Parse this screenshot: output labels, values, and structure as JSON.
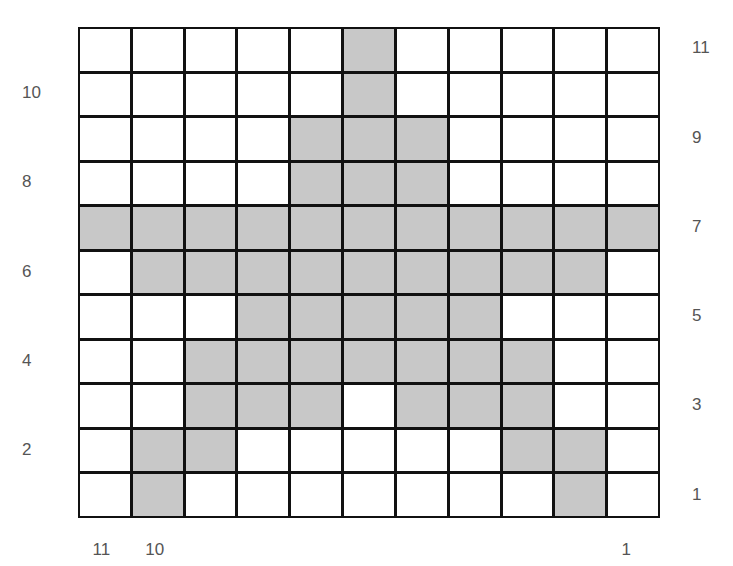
{
  "figure": {
    "rows": 11,
    "cols": 11,
    "shade_color": "#c8c8c8",
    "line_color": "#111111",
    "left_labels": [
      {
        "text": "10",
        "row": 10
      },
      {
        "text": "8",
        "row": 8
      },
      {
        "text": "6",
        "row": 6
      },
      {
        "text": "4",
        "row": 4
      },
      {
        "text": "2",
        "row": 2
      }
    ],
    "right_labels": [
      {
        "text": "11",
        "row": 11
      },
      {
        "text": "9",
        "row": 9
      },
      {
        "text": "7",
        "row": 7
      },
      {
        "text": "5",
        "row": 5
      },
      {
        "text": "3",
        "row": 3
      },
      {
        "text": "1",
        "row": 1
      }
    ],
    "bottom_labels": [
      {
        "text": "11",
        "col": 1
      },
      {
        "text": "10",
        "col": 2
      },
      {
        "text": "1",
        "col": 11
      }
    ],
    "shaded_cells": {
      "11": [
        6
      ],
      "10": [
        6
      ],
      "9": [
        5,
        6,
        7
      ],
      "8": [
        5,
        6,
        7
      ],
      "7": [
        1,
        2,
        3,
        4,
        5,
        6,
        7,
        8,
        9,
        10,
        11
      ],
      "6": [
        2,
        3,
        4,
        5,
        6,
        7,
        8,
        9,
        10
      ],
      "5": [
        4,
        5,
        6,
        7,
        8
      ],
      "4": [
        3,
        4,
        5,
        6,
        7,
        8,
        9
      ],
      "3": [
        3,
        4,
        5,
        7,
        8,
        9
      ],
      "2": [
        2,
        3,
        9,
        10
      ],
      "1": [
        2,
        10
      ]
    }
  }
}
